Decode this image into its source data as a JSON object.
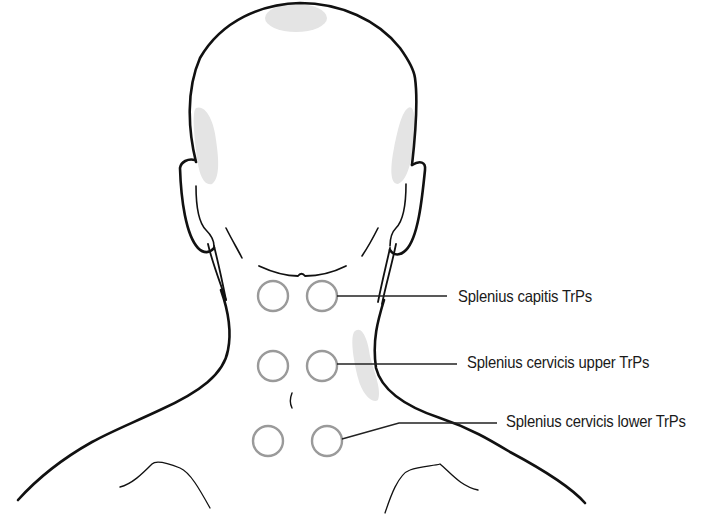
{
  "figure": {
    "colors": {
      "outline": "#111111",
      "trp_circle": "#9a9a9a",
      "pain_zone": "#e4e4e4",
      "leader_line": "#222222",
      "label_text": "#1a1a1a"
    },
    "labels": [
      {
        "text": "Splenius capitis TrPs",
        "x": 458,
        "y": 298
      },
      {
        "text": "Splenius cervicis upper TrPs",
        "x": 467,
        "y": 364
      },
      {
        "text": "Splenius cervicis lower TrPs",
        "x": 506,
        "y": 423
      }
    ],
    "trigger_points": [
      {
        "group": "Splenius capitis TrPs",
        "circles": [
          {
            "cx": 273,
            "cy": 296
          },
          {
            "cx": 322,
            "cy": 296
          }
        ]
      },
      {
        "group": "Splenius cervicis upper TrPs",
        "circles": [
          {
            "cx": 273,
            "cy": 366
          },
          {
            "cx": 322,
            "cy": 366
          }
        ]
      },
      {
        "group": "Splenius cervicis lower TrPs",
        "circles": [
          {
            "cx": 268,
            "cy": 441
          },
          {
            "cx": 327,
            "cy": 441
          }
        ]
      }
    ],
    "referred_pain_zones": [
      "vertex",
      "left-temporal",
      "right-temporal",
      "right-neck-base"
    ]
  }
}
